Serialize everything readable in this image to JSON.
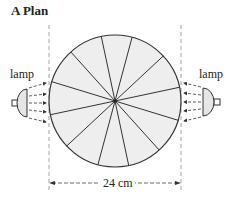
{
  "title": "A Plan",
  "labels": {
    "lamp_left": "lamp",
    "lamp_right": "lamp",
    "dimension": "24 cm"
  },
  "diagram": {
    "circle": {
      "cx": 115,
      "cy": 101,
      "r": 66,
      "fill": "#eeeeee",
      "stroke": "#333333"
    },
    "segments": 12,
    "diameter_angles_deg": [
      -12,
      -43,
      -75,
      -102,
      -132,
      -163
    ],
    "dashed_guides_x": [
      49,
      181
    ],
    "dimension_line_y": 183,
    "arrows_per_lamp": 5,
    "colors": {
      "line": "#333333",
      "fill": "#eeeeee",
      "guide": "#888888"
    }
  }
}
